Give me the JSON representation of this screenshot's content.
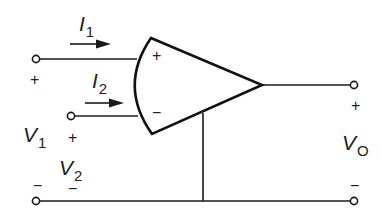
{
  "diagram": {
    "currents": [
      {
        "symbol": "I",
        "subscript": "1"
      },
      {
        "symbol": "I",
        "subscript": "2"
      }
    ],
    "voltages": {
      "v1": {
        "symbol": "V",
        "subscript": "1",
        "plus": "+",
        "minus": "−"
      },
      "v2": {
        "symbol": "V",
        "subscript": "2",
        "plus": "+",
        "minus": "−"
      },
      "vo": {
        "symbol": "V",
        "subscript": "O",
        "plus": "+",
        "minus": "−"
      }
    },
    "opamp_pins": {
      "noninverting": "+",
      "inverting": "−"
    },
    "colors": {
      "stroke": "#1a1a1a",
      "background": "#ffffff"
    }
  }
}
